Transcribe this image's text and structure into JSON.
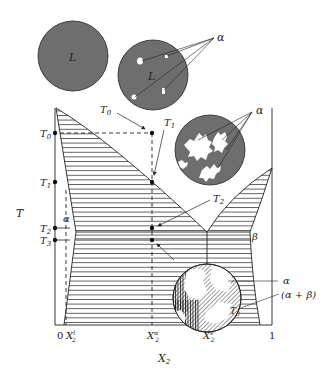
{
  "colors": {
    "phase_fill": "#6e6e6e",
    "line": "#222222",
    "hatch": "#333333",
    "background": "#ffffff"
  },
  "axes": {
    "y_label": "T",
    "x_label": "X2",
    "x_label_sub": "2",
    "x_ticks": [
      {
        "label": "0",
        "x": 60
      },
      {
        "label": "X",
        "sup": "l",
        "sub": "2",
        "x": 70
      },
      {
        "label": "X",
        "sup": "α",
        "sub": "2",
        "x": 152
      },
      {
        "label": "X",
        "sup": "e",
        "sub": "2",
        "x": 208
      },
      {
        "label": "1",
        "x": 271
      }
    ],
    "y_ticks": [
      {
        "label": "T",
        "sub": "0",
        "y": 133
      },
      {
        "label": "T",
        "sub": "1",
        "y": 182
      },
      {
        "label": "T",
        "sub": "2",
        "y": 228
      },
      {
        "label": "T",
        "sub": "3",
        "y": 240
      }
    ]
  },
  "regions": {
    "liquid": "L",
    "alpha": "α",
    "beta": "β",
    "two_phase": "(α + β)"
  },
  "points": [
    {
      "name": "T0",
      "label": "T",
      "sub": "0",
      "x": 152,
      "y": 133
    },
    {
      "name": "T1",
      "label": "T",
      "sub": "1",
      "x": 152,
      "y": 182
    },
    {
      "name": "T2",
      "label": "T",
      "sub": "2",
      "x": 152,
      "y": 228
    },
    {
      "name": "T3",
      "label": "T",
      "sub": "3",
      "x": 152,
      "y": 240
    }
  ],
  "microstructures": [
    {
      "name": "liquid-only",
      "label": "L",
      "cx": 73,
      "cy": 56,
      "r": 35
    },
    {
      "name": "liquid-with-alpha-nuclei",
      "label": "L",
      "cx": 153,
      "cy": 75,
      "r": 35,
      "annotation": "α"
    },
    {
      "name": "alpha-dendrites-in-liquid",
      "cx": 210,
      "cy": 150,
      "r": 35,
      "annotation": "α"
    },
    {
      "name": "alpha-plus-eutectic",
      "cx": 207,
      "cy": 298,
      "r": 35,
      "annotations": [
        "α",
        "(α + β)",
        "T3"
      ]
    }
  ]
}
